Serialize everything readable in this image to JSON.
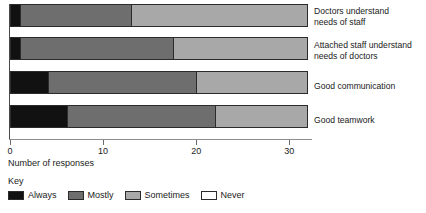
{
  "chart_data": {
    "type": "bar",
    "orientation": "horizontal",
    "stacked": true,
    "title": "",
    "xlabel": "Number of responses",
    "ylabel": "",
    "xlim": [
      0,
      32
    ],
    "xticks": [
      0,
      10,
      20,
      30
    ],
    "xtick_labels": [
      "0",
      "10",
      "20",
      "30"
    ],
    "grid": false,
    "legend_position": "bottom-left",
    "legend_title": "Key",
    "categories": [
      "Doctors understand\nneeds of staff",
      "Attached staff understand\nneeds of doctors",
      "Good communication",
      "Good teamwork"
    ],
    "series": [
      {
        "name": "Always",
        "color": "#111111",
        "values": [
          1,
          1,
          4,
          6
        ]
      },
      {
        "name": "Mostly",
        "color": "#6e6e6e",
        "values": [
          12,
          16.5,
          16,
          16
        ]
      },
      {
        "name": "Sometimes",
        "color": "#a8a8a8",
        "values": [
          19,
          14.5,
          12,
          10
        ]
      },
      {
        "name": "Never",
        "color": "#ffffff",
        "values": [
          0,
          0,
          0,
          0
        ]
      }
    ],
    "totals": [
      32,
      32,
      32,
      32
    ]
  },
  "axis": {
    "x_title": "Number of responses",
    "ticks": [
      {
        "value": "0",
        "label": "0"
      },
      {
        "value": "10",
        "label": "10"
      },
      {
        "value": "20",
        "label": "20"
      },
      {
        "value": "30",
        "label": "30"
      }
    ]
  },
  "legend": {
    "title": "Key",
    "items": [
      {
        "label": "Always",
        "color": "#111111"
      },
      {
        "label": "Mostly",
        "color": "#6e6e6e"
      },
      {
        "label": "Sometimes",
        "color": "#a8a8a8"
      },
      {
        "label": "Never",
        "color": "#ffffff"
      }
    ]
  },
  "category_labels": [
    "Doctors understand\nneeds of staff",
    "Attached staff understand\nneeds of doctors",
    "Good communication",
    "Good teamwork"
  ]
}
